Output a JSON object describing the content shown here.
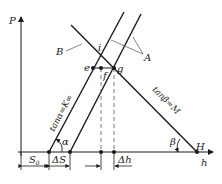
{
  "diagram": {
    "axes": {
      "y_label": "P",
      "x_label": "h",
      "x_end_label": "H"
    },
    "lines": {
      "parallel_group_label": "A",
      "descending_line_label": "B",
      "left_slope_label": "tanα=K∞",
      "right_slope_label": "tanβ=M"
    },
    "angles": {
      "alpha": "α",
      "beta": "β"
    },
    "points": {
      "i": "i",
      "e": "e",
      "f": "f",
      "g": "g"
    },
    "dimensions": {
      "s0": "S",
      "s0_sub": "0",
      "delta_s": "ΔS",
      "delta_h": "Δh"
    },
    "colors": {
      "line": "#1a1a1a",
      "dashed": "#555555",
      "leader": "#666666",
      "background": "#ffffff"
    }
  }
}
